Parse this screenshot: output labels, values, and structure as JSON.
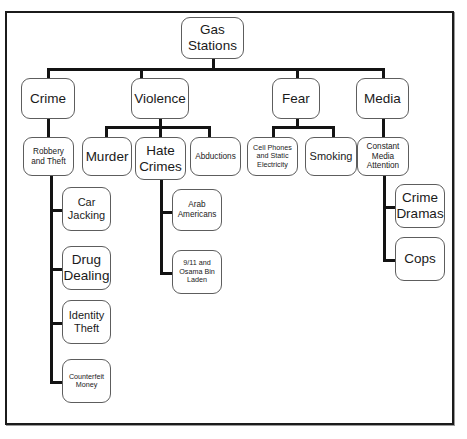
{
  "diagram": {
    "title": "Gas Stations",
    "type": "concept-map",
    "root": {
      "label": "Gas Stations"
    },
    "level1": [
      {
        "label": "Crime"
      },
      {
        "label": "Violence"
      },
      {
        "label": "Fear"
      },
      {
        "label": "Media"
      }
    ],
    "level2": [
      {
        "label": "Robbery and Theft",
        "parent": "Crime"
      },
      {
        "label": "Murder",
        "parent": "Violence"
      },
      {
        "label": "Hate Crimes",
        "parent": "Violence"
      },
      {
        "label": "Abductions",
        "parent": "Violence"
      },
      {
        "label": "Cell Phones and Static Electricity",
        "parent": "Fear"
      },
      {
        "label": "Smoking",
        "parent": "Fear"
      },
      {
        "label": "Constant Media Attention",
        "parent": "Media"
      }
    ],
    "level3": [
      {
        "label": "Car Jacking",
        "parent": "Robbery and Theft"
      },
      {
        "label": "Drug Dealing",
        "parent": "Robbery and Theft"
      },
      {
        "label": "Identity Theft",
        "parent": "Robbery and Theft"
      },
      {
        "label": "Counterfeit Money",
        "parent": "Robbery and Theft"
      },
      {
        "label": "Arab Americans",
        "parent": "Hate Crimes"
      },
      {
        "label": "9/11 and Osama Bin Laden",
        "parent": "Hate Crimes"
      },
      {
        "label": "Crime Dramas",
        "parent": "Constant Media Attention"
      },
      {
        "label": "Cops",
        "parent": "Constant Media Attention"
      }
    ],
    "colors": {
      "node_border": "#5d5d5d",
      "edge": "#131313",
      "frame": "#1b1b1b",
      "background": "#ffffff",
      "text": "#1a1a1a"
    }
  }
}
